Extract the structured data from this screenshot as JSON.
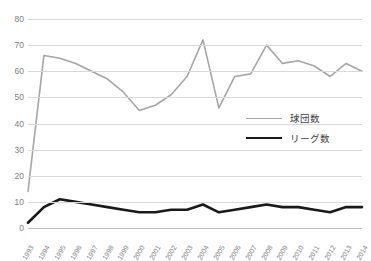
{
  "chart_data": {
    "type": "line",
    "title": "",
    "xlabel": "",
    "ylabel": "",
    "ylim": [
      0,
      80
    ],
    "ytick_step": 10,
    "grid": true,
    "legend_position": "center-right",
    "yticks": [
      "0",
      "10",
      "20",
      "30",
      "40",
      "50",
      "60",
      "70",
      "80"
    ],
    "categories": [
      "1993",
      "1994",
      "1995",
      "1996",
      "1997",
      "1998",
      "1999",
      "2000",
      "2001",
      "2002",
      "2003",
      "2004",
      "2005",
      "2006",
      "2007",
      "2008",
      "2009",
      "2010",
      "2011",
      "2012",
      "2013",
      "2014"
    ],
    "series": [
      {
        "name": "球団数",
        "color": "#a6a6a6",
        "width": 1.6,
        "values": [
          14,
          66,
          65,
          63,
          60,
          57,
          52,
          45,
          47,
          51,
          58,
          72,
          46,
          58,
          59,
          70,
          63,
          64,
          62,
          58,
          63,
          60
        ]
      },
      {
        "name": "リーグ数",
        "color": "#1a1a1a",
        "width": 2.6,
        "values": [
          2,
          8,
          11,
          10,
          9,
          8,
          7,
          6,
          6,
          7,
          7,
          9,
          6,
          7,
          8,
          9,
          8,
          8,
          7,
          6,
          8,
          8
        ]
      }
    ]
  },
  "legend": {
    "items": [
      {
        "label": "球団数"
      },
      {
        "label": "リーグ数"
      }
    ]
  }
}
